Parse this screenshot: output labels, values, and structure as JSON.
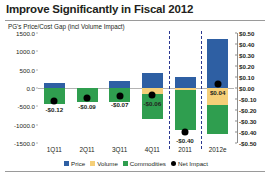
{
  "title": "Improve Significantly in Fiscal 2012",
  "subtitle": "PG's Price/Cost Gap (incl Volume Impact)",
  "colors": {
    "price": "#2e5fa3",
    "volume": "#f5cf78",
    "commodities": "#2f9e4f",
    "net_impact": "#000000",
    "divider": "#2b3990"
  },
  "legend": [
    {
      "label": "Price",
      "swatch": "price-swatch"
    },
    {
      "label": "Volume",
      "swatch": "volume-swatch"
    },
    {
      "label": "Commodities",
      "swatch": "commodities-swatch"
    },
    {
      "label": "Net Impact",
      "swatch": "net-impact-swatch"
    }
  ],
  "chart_data": {
    "type": "bar",
    "title": "PG's Price/Cost Gap (incl Volume Impact)",
    "xlabel": "",
    "ylabel": "",
    "grid": false,
    "legend_position": "bottom",
    "categories": [
      "1Q11",
      "2Q11",
      "3Q11",
      "4Q11",
      "2011",
      "2012e"
    ],
    "left_axis": {
      "ticks": [
        "1500.0",
        "1000.0",
        "500.0",
        "0.0",
        "-500.0",
        "-1000.0",
        "-1500.0"
      ],
      "values": [
        1500,
        1000,
        500,
        0,
        -500,
        -1000,
        -1500
      ],
      "ylim": [
        -1500,
        1500
      ]
    },
    "right_axis": {
      "ticks": [
        "$0.50",
        "$0.40",
        "$0.30",
        "$0.20",
        "$0.10",
        "$0.00",
        "-$0.10",
        "-$0.20",
        "-$0.30",
        "-$0.40",
        "-$0.50"
      ],
      "values": [
        0.5,
        0.4,
        0.3,
        0.2,
        0.1,
        0.0,
        -0.1,
        -0.2,
        -0.3,
        -0.4,
        -0.5
      ],
      "ylim": [
        -0.5,
        0.5
      ]
    },
    "series": [
      {
        "name": "Price",
        "values": [
          150,
          0,
          200,
          400,
          300,
          1350
        ]
      },
      {
        "name": "Volume",
        "values": [
          0,
          0,
          0,
          -150,
          -60,
          -450
        ]
      },
      {
        "name": "Commodities",
        "values": [
          -430,
          -380,
          -370,
          -700,
          -1080,
          -800
        ]
      }
    ],
    "net_impact": {
      "name": "Net Impact",
      "values": [
        -0.12,
        -0.09,
        -0.07,
        -0.06,
        -0.4,
        0.04
      ],
      "labels": [
        "-$0.12",
        "-$0.09",
        "-$0.07",
        "-$0.06",
        "-$0.40",
        "$0.04"
      ]
    }
  }
}
